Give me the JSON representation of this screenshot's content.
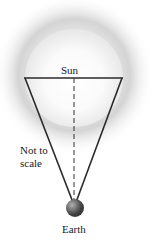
{
  "labels": {
    "sun": "Sun",
    "not_to_scale": "Not to scale",
    "earth": "Earth"
  },
  "colors": {
    "background": "#ffffff",
    "glow_outer": "#c8c8c8",
    "sun_disk": "#f4f4f4",
    "lines": "#2a2a2a",
    "earth": "#6e6e6e"
  }
}
